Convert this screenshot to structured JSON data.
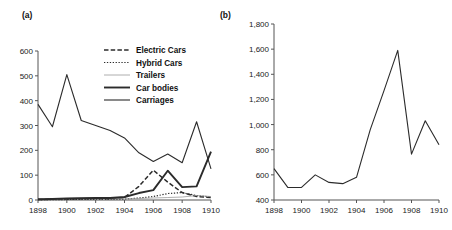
{
  "figure": {
    "panels": [
      {
        "label": "(a)",
        "chart_data": {
          "type": "line",
          "title": "",
          "xlabel": "",
          "ylabel": "",
          "x": [
            1898,
            1899,
            1900,
            1901,
            1902,
            1903,
            1904,
            1905,
            1906,
            1907,
            1908,
            1909,
            1910
          ],
          "xlim": [
            1898,
            1910
          ],
          "ylim": [
            0,
            600
          ],
          "yticks": [
            0,
            100,
            200,
            300,
            400,
            500,
            600
          ],
          "ytick_labels": [
            "0",
            "100",
            "200",
            "300",
            "400",
            "500",
            "600"
          ],
          "xticks": [
            1898,
            1900,
            1902,
            1904,
            1906,
            1908,
            1910
          ],
          "xtick_labels": [
            "1898",
            "1900",
            "1902",
            "1904",
            "1906",
            "1908",
            "1910"
          ],
          "grid": false,
          "legend_position": "upper-center",
          "series": [
            {
              "name": "Electric Cars",
              "style": "dashed",
              "values": [
                2,
                3,
                4,
                5,
                6,
                5,
                10,
                55,
                120,
                72,
                30,
                14,
                10
              ]
            },
            {
              "name": "Hybrid Cars",
              "style": "dotted",
              "values": [
                1,
                1,
                2,
                2,
                3,
                3,
                4,
                8,
                14,
                26,
                30,
                18,
                12
              ]
            },
            {
              "name": "Trailers",
              "style": "thin",
              "values": [
                2,
                3,
                6,
                8,
                9,
                7,
                5,
                6,
                8,
                10,
                12,
                18,
                14
              ]
            },
            {
              "name": "Car bodies",
              "style": "thick",
              "values": [
                3,
                4,
                6,
                7,
                8,
                8,
                12,
                28,
                40,
                118,
                52,
                55,
                195
              ]
            },
            {
              "name": "Carriages",
              "style": "medium",
              "values": [
                385,
                295,
                505,
                320,
                300,
                280,
                250,
                190,
                155,
                185,
                150,
                315,
                125
              ]
            }
          ]
        }
      },
      {
        "label": "(b)",
        "chart_data": {
          "type": "line",
          "title": "",
          "xlabel": "",
          "ylabel": "",
          "x": [
            1898,
            1899,
            1900,
            1901,
            1902,
            1903,
            1904,
            1905,
            1906,
            1907,
            1908,
            1909,
            1910
          ],
          "xlim": [
            1898,
            1910
          ],
          "ylim": [
            400,
            1800
          ],
          "yticks": [
            400,
            600,
            800,
            1000,
            1200,
            1400,
            1600,
            1800
          ],
          "ytick_labels": [
            "400",
            "600",
            "800",
            "1,000",
            "1,200",
            "1,400",
            "1,600",
            "1,800"
          ],
          "xticks": [
            1898,
            1900,
            1902,
            1904,
            1906,
            1908,
            1910
          ],
          "xtick_labels": [
            "1898",
            "1900",
            "1902",
            "1904",
            "1906",
            "1908",
            "1910"
          ],
          "grid": false,
          "legend_position": "none",
          "series": [
            {
              "name": "Total",
              "style": "medium",
              "values": [
                650,
                500,
                500,
                600,
                540,
                530,
                580,
                960,
                1270,
                1590,
                765,
                1030,
                840
              ]
            }
          ]
        }
      }
    ]
  },
  "colors": {
    "line": "#2b2b2b",
    "axis": "#555555",
    "trailers": "#9a9a9a",
    "text": "#1a1a1a",
    "background": "#ffffff"
  }
}
